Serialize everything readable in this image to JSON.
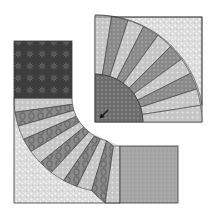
{
  "figure": {
    "blocks": [
      {
        "name": "fan-block",
        "position": "upper-right",
        "blades": 10,
        "center": "dark dotted quarter circle"
      },
      {
        "name": "arc-block",
        "position": "lower-left",
        "blades": 12,
        "corners": [
          "dark star print square",
          "medium speckled square"
        ]
      }
    ],
    "arrow": {
      "direction": "down-left"
    }
  },
  "colors": {
    "background": "#ffffff",
    "outline": "#3a3a3a",
    "light_blade": "#c8c8c8",
    "medium_blade": "#8c8c8c",
    "dark_center": "#6e6e6e",
    "speckle_bg": "#dedede",
    "dark_square": "#404040",
    "medium_square": "#a8a8a8",
    "oval_blade": "#7c7c7c"
  }
}
